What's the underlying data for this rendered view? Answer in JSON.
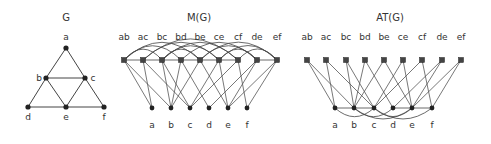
{
  "colors": {
    "node": "#222222",
    "edge": "#555555",
    "text": "#333333",
    "background": "#ffffff"
  },
  "panels": {
    "g": {
      "title": "G",
      "vertices": [
        {
          "id": "a",
          "label": "a",
          "x": 66,
          "y": 48,
          "lx": 66,
          "ly": 40
        },
        {
          "id": "b",
          "label": "b",
          "x": 46,
          "y": 78,
          "lx": 39,
          "ly": 81
        },
        {
          "id": "c",
          "label": "c",
          "x": 85,
          "y": 78,
          "lx": 93,
          "ly": 81
        },
        {
          "id": "d",
          "label": "d",
          "x": 28,
          "y": 107,
          "lx": 28,
          "ly": 120
        },
        {
          "id": "e",
          "label": "e",
          "x": 66,
          "y": 107,
          "lx": 66,
          "ly": 120
        },
        {
          "id": "f",
          "label": "f",
          "x": 104,
          "y": 107,
          "lx": 104,
          "ly": 120
        }
      ],
      "edges": [
        [
          "a",
          "b"
        ],
        [
          "a",
          "c"
        ],
        [
          "b",
          "c"
        ],
        [
          "b",
          "d"
        ],
        [
          "b",
          "e"
        ],
        [
          "c",
          "e"
        ],
        [
          "c",
          "f"
        ],
        [
          "d",
          "e"
        ],
        [
          "e",
          "f"
        ]
      ]
    },
    "m": {
      "title": "M(G)",
      "edge_nodes": [
        "ab",
        "ac",
        "bc",
        "bd",
        "be",
        "ce",
        "cf",
        "de",
        "ef"
      ],
      "edge_x": [
        124,
        143,
        162,
        181,
        200,
        219,
        238,
        257,
        277
      ],
      "vertex_nodes": [
        "a",
        "b",
        "c",
        "d",
        "e",
        "f"
      ],
      "vertex_x": [
        152,
        171,
        190,
        209,
        228,
        247
      ]
    },
    "at": {
      "title": "AT(G)",
      "edge_nodes": [
        "ab",
        "ac",
        "bc",
        "bd",
        "be",
        "ce",
        "cf",
        "de",
        "ef"
      ],
      "edge_x": [
        307,
        326,
        346,
        365,
        384,
        403,
        422,
        442,
        461
      ],
      "vertex_nodes": [
        "a",
        "b",
        "c",
        "d",
        "e",
        "f"
      ],
      "vertex_x": [
        335,
        354,
        374,
        393,
        412,
        432
      ]
    }
  }
}
